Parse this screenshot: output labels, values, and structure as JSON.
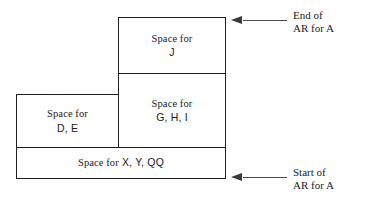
{
  "diagram": {
    "stack_frames": [
      {
        "id": "j",
        "prefix": "Space for",
        "contents": "J",
        "name": "space-for-j"
      },
      {
        "id": "ghi",
        "prefix": "Space for",
        "contents": "G, H, I",
        "name": "space-for-g-h-i"
      },
      {
        "id": "de",
        "prefix": "Space for",
        "contents": "D, E",
        "name": "space-for-d-e"
      },
      {
        "id": "xyqq",
        "prefix": "Space for",
        "contents": "X, Y, QQ",
        "name": "space-for-x-y-qq"
      }
    ],
    "annotations": [
      {
        "id": "end",
        "line1": "End of",
        "line2": "AR for A",
        "icon": "left-arrow-icon"
      },
      {
        "id": "start",
        "line1": "Start of",
        "line2": "AR for A",
        "icon": "left-arrow-icon"
      }
    ],
    "colors": {
      "background": "#ffffff",
      "box_border": "#1f1f1f",
      "text": "#1a1a1a",
      "annotation_line": "#4a4a4a"
    }
  }
}
